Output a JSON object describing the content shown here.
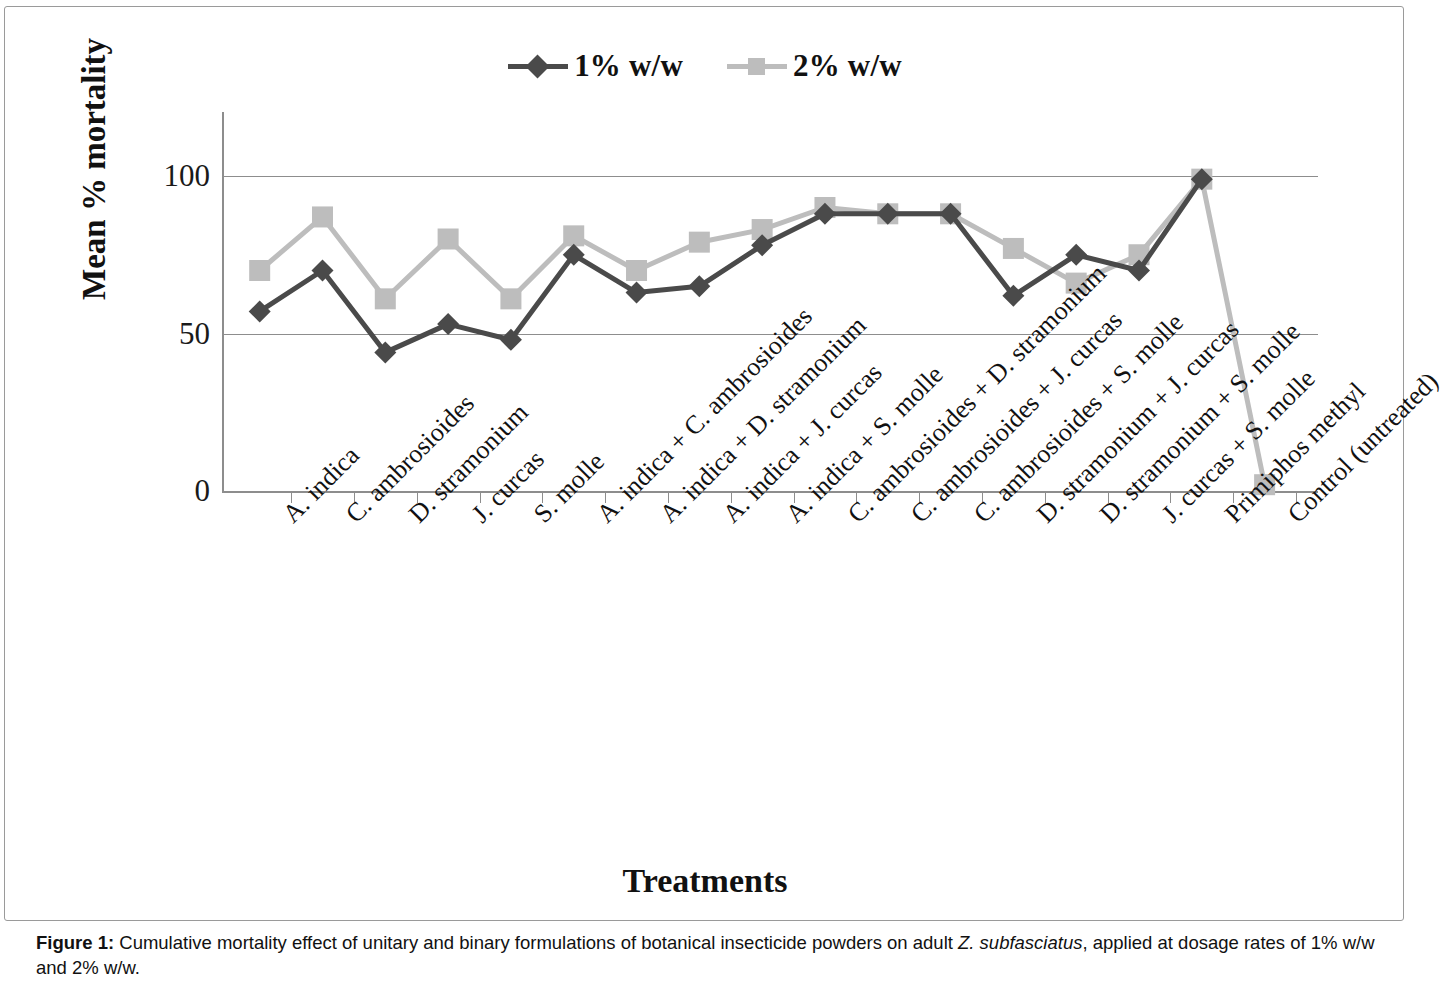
{
  "figure": {
    "caption_label": "Figure 1:",
    "caption_part1": " Cumulative mortality effect of unitary and binary formulations of botanical insecticide powders on adult ",
    "caption_italic": "Z. subfasciatus",
    "caption_part2": ", applied at dosage rates of 1% w/w and 2% w/w."
  },
  "chart_data": {
    "type": "line",
    "title": "",
    "xlabel": "Treatments",
    "ylabel": "Mean % mortality",
    "ylim": [
      0,
      110
    ],
    "yticks": [
      0,
      50,
      100
    ],
    "ytick_labels": [
      "0",
      "50",
      "100"
    ],
    "grid": true,
    "legend_position": "top-center",
    "categories": [
      "A. indica",
      "C. ambrosioides",
      "D. stramonium",
      "J. curcas",
      "S. molle",
      "A. indica + C. ambrosioides",
      "A. indica + D. stramonium",
      "A. indica + J. curcas",
      "A. indica + S. molle",
      "C. ambrosioides + D. stramonium",
      "C. ambrosioides + J. curcas",
      "C. ambrosioides + S. molle",
      "D. stramonium + J. curcas",
      "D. stramonium + S. molle",
      "J. curcas + S. molle",
      "Primiphos methyl",
      "Control (untreated)"
    ],
    "series": [
      {
        "name": "1% w/w",
        "color": "#4a4a4a",
        "marker": "diamond",
        "values": [
          57,
          70,
          44,
          53,
          48,
          75,
          63,
          65,
          78,
          88,
          88,
          88,
          62,
          75,
          70,
          99,
          null
        ]
      },
      {
        "name": "2% w/w",
        "color": "#bdbdbd",
        "marker": "square",
        "values": [
          70,
          87,
          61,
          80,
          61,
          81,
          70,
          79,
          83,
          90,
          88,
          88,
          77,
          66,
          75,
          99,
          2
        ]
      }
    ]
  },
  "legend": {
    "items": [
      {
        "label": "1% w/w",
        "marker": "diamond-marker",
        "color": "#4a4a4a"
      },
      {
        "label": "2% w/w",
        "marker": "square-marker",
        "color": "#bdbdbd"
      }
    ]
  },
  "colors": {
    "axis": "#8d8d8d",
    "grid": "#8d8d8d",
    "series1": "#4a4a4a",
    "series2": "#bdbdbd",
    "text": "#111111",
    "frame": "#9a9a9a"
  }
}
